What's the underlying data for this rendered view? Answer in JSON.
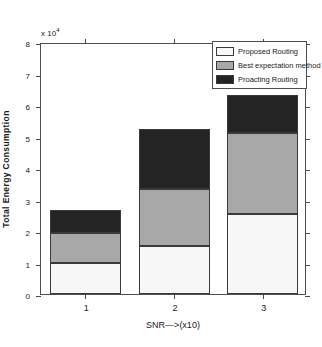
{
  "chart_data": {
    "type": "bar",
    "subtype": "stacked",
    "title": "",
    "xlabel": "SNR—>(x10)",
    "ylabel": "Total Energy Consumption",
    "y_exponent_label": "x 10",
    "y_exponent_power": "4",
    "categories": [
      "1",
      "2",
      "3"
    ],
    "x_tick_labels": [
      "1",
      "2",
      "3"
    ],
    "y_tick_labels": [
      "0",
      "1",
      "2",
      "3",
      "4",
      "5",
      "6",
      "7",
      "8"
    ],
    "y_tick_values": [
      0,
      1,
      2,
      3,
      4,
      5,
      6,
      7,
      8
    ],
    "ylim": [
      0,
      8
    ],
    "y_units": "x10^4",
    "grid": false,
    "legend_position": "top-right",
    "series": [
      {
        "name": "Proposed Routing",
        "color": "#f7f7f7",
        "values": [
          0.98,
          1.52,
          2.54
        ]
      },
      {
        "name": "Best expectation method",
        "color": "#a8a8a8",
        "values": [
          0.96,
          1.81,
          2.57
        ]
      },
      {
        "name": "Proacting Routing",
        "color": "#242424",
        "values": [
          0.73,
          1.91,
          1.21
        ]
      }
    ],
    "cumulative_tops": [
      [
        0.98,
        1.94,
        2.67
      ],
      [
        1.52,
        3.33,
        5.24
      ],
      [
        2.54,
        5.11,
        6.32
      ]
    ]
  },
  "legend": {
    "items": [
      {
        "label": "Proposed Routing",
        "color": "#f7f7f7"
      },
      {
        "label": "Best expectation method",
        "color": "#a8a8a8"
      },
      {
        "label": "Proacting Routing",
        "color": "#242424"
      }
    ]
  }
}
